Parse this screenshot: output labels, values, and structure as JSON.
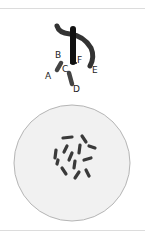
{
  "diagram": {
    "top_figure": {
      "description": "chromosome fragments with labels",
      "labels": [
        "A",
        "B",
        "C",
        "D",
        "E",
        "F"
      ]
    },
    "bottom_figure": {
      "description": "cell with scattered chromosomes",
      "chromosome_count": 13
    },
    "colors": {
      "chromosome": "#2b2b2b",
      "cell_fill": "#f1f1f1",
      "cell_border": "#b5b5b5",
      "rule": "#dcdcdc"
    }
  }
}
